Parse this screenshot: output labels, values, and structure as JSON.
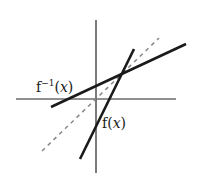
{
  "diagram": {
    "title": "",
    "axes": {
      "x_axis": {
        "x1": 16,
        "y1": 99,
        "x2": 176,
        "y2": 99,
        "color": "#222222"
      },
      "y_axis": {
        "x1": 96,
        "y1": 20,
        "x2": 96,
        "y2": 173,
        "color": "#222222"
      }
    },
    "lines": [
      {
        "name": "f-inverse",
        "label_prefix": "f",
        "label_sup": "−1",
        "label_open": "(",
        "label_var": "x",
        "label_close": ")",
        "x1": 51,
        "y1": 107,
        "x2": 186,
        "y2": 44,
        "style": "solid",
        "color": "#1a1a1a"
      },
      {
        "name": "f",
        "label_prefix": "f",
        "label_open": "(",
        "label_var": "x",
        "label_close": ")",
        "x1": 80,
        "y1": 159,
        "x2": 134,
        "y2": 49,
        "style": "solid",
        "color": "#1a1a1a"
      },
      {
        "name": "identity",
        "x1": 42,
        "y1": 151,
        "x2": 159,
        "y2": 38,
        "style": "dashed",
        "color": "#888888"
      }
    ],
    "labels": {
      "f_inverse": "f",
      "f_inverse_sup": "−1",
      "f": "f",
      "open": "(",
      "var": "x",
      "close": ")"
    }
  }
}
